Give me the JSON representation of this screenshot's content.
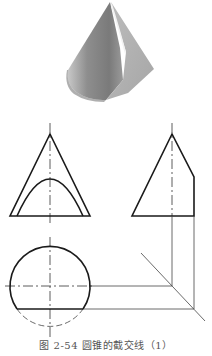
{
  "figure": {
    "caption": "图 2-54   圆锥的截交线（1）",
    "colors": {
      "outline": "#1a1a1a",
      "thin_line": "#444444",
      "centerline": "#333333",
      "background": "#ffffff",
      "shade_light": "#d8d8d8",
      "shade_mid": "#9a9a9a",
      "shade_dark": "#6a6a6a"
    },
    "views": {
      "isometric": {
        "label": "cone-cut-by-plane-3d-render"
      },
      "front_view": {
        "apex": [
          50,
          134
        ],
        "base_left": [
          10,
          216
        ],
        "base_right": [
          90,
          216
        ],
        "hyperbola_left": [
          17,
          216
        ],
        "hyperbola_peak": [
          50,
          179
        ],
        "hyperbola_right": [
          83,
          216
        ],
        "centerline_x": 50
      },
      "side_view": {
        "apex": [
          172,
          134
        ],
        "base_left": [
          132,
          216
        ],
        "cut_top": [
          194,
          177
        ],
        "cut_bottom": [
          194,
          216
        ],
        "centerline_x": 172
      },
      "top_view": {
        "center": [
          50,
          286
        ],
        "radius": 40,
        "chord_y": 309,
        "chord_left": [
          17,
          309
        ],
        "chord_right": [
          83,
          309
        ]
      },
      "projection": {
        "miter_start": [
          141,
          253
        ],
        "miter_end": [
          205,
          321
        ]
      }
    }
  }
}
